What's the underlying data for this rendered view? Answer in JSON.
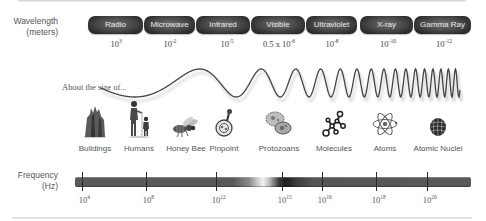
{
  "diagram": {
    "wavelength_axis": {
      "label_line1": "Wavelength",
      "label_line2": "(meters)"
    },
    "bands": [
      {
        "name": "Radio",
        "wavelength_base": "10",
        "wavelength_exp": "3",
        "wavelength_prefix": ""
      },
      {
        "name": "Microwave",
        "wavelength_base": "10",
        "wavelength_exp": "-2",
        "wavelength_prefix": ""
      },
      {
        "name": "Infrared",
        "wavelength_base": "10",
        "wavelength_exp": "-5",
        "wavelength_prefix": ""
      },
      {
        "name": "Visible",
        "wavelength_base": "10",
        "wavelength_exp": "-6",
        "wavelength_prefix": "0.5 x "
      },
      {
        "name": "Ultraviolet",
        "wavelength_base": "10",
        "wavelength_exp": "-8",
        "wavelength_prefix": ""
      },
      {
        "name": "X-ray",
        "wavelength_base": "10",
        "wavelength_exp": "-10",
        "wavelength_prefix": ""
      },
      {
        "name": "Gamma Ray",
        "wavelength_base": "10",
        "wavelength_exp": "-12",
        "wavelength_prefix": ""
      }
    ],
    "size_caption": "About the size of...",
    "size_objects": [
      {
        "label": "Buildings",
        "icon": "building-icon"
      },
      {
        "label": "Humans",
        "icon": "humans-icon"
      },
      {
        "label": "Honey Bee",
        "icon": "bee-icon"
      },
      {
        "label": "Pinpoint",
        "icon": "pinpoint-icon"
      },
      {
        "label": "Protozoans",
        "icon": "protozoan-icon"
      },
      {
        "label": "Molecules",
        "icon": "molecule-icon"
      },
      {
        "label": "Atoms",
        "icon": "atom-icon"
      },
      {
        "label": "Atomic Nuclei",
        "icon": "nucleus-icon"
      }
    ],
    "frequency_axis": {
      "label_line1": "Frequency",
      "label_line2": "(Hz)",
      "ticks": [
        {
          "base": "10",
          "exp": "4"
        },
        {
          "base": "10",
          "exp": "8"
        },
        {
          "base": "10",
          "exp": "12"
        },
        {
          "base": "10",
          "exp": "15"
        },
        {
          "base": "10",
          "exp": "16"
        },
        {
          "base": "10",
          "exp": "18"
        },
        {
          "base": "10",
          "exp": "20"
        }
      ]
    },
    "colors": {
      "pill_dark": "#262626",
      "pill_text": "#e6e6e6",
      "bar_base": "#5a5a5a",
      "visible_highlight": "#f2f2f2",
      "text": "#555555"
    }
  }
}
